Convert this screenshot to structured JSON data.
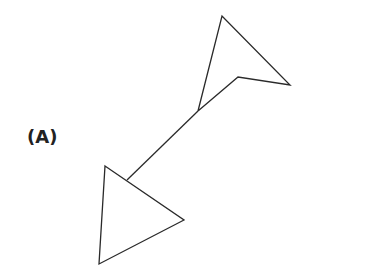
{
  "figure": {
    "label": "(A)",
    "stroke_color": "#2a2a2a",
    "shapes": {
      "upper_arrowhead": [
        [
          222,
          16
        ],
        [
          290,
          85
        ],
        [
          238,
          77
        ],
        [
          198,
          111
        ]
      ],
      "connector_line": [
        [
          198,
          111
        ],
        [
          238,
          77
        ]
      ],
      "shaft": [
        [
          198,
          111
        ],
        [
          127,
          180
        ]
      ],
      "lower_triangle": [
        [
          105,
          166
        ],
        [
          184,
          220
        ],
        [
          99,
          264
        ]
      ]
    }
  }
}
